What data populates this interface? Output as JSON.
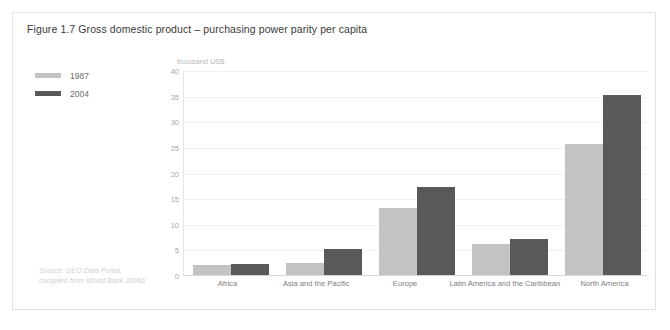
{
  "figure": {
    "title": "Figure 1.7 Gross domestic product – purchasing power parity per capita",
    "source": "Source: GEO Data Portal, compiled from World Bank 2006b"
  },
  "legend": {
    "items": [
      {
        "label": "1987",
        "color": "#c3c3c3"
      },
      {
        "label": "2004",
        "color": "#595959"
      }
    ]
  },
  "chart_data": {
    "type": "bar",
    "title": "Figure 1.7 Gross domestic product – purchasing power parity per capita",
    "xlabel": "",
    "ylabel": "thousand US$",
    "unit_label": "thousand US$",
    "categories": [
      "Africa",
      "Asia and the Pacific",
      "Europe",
      "Latin America and the Caribbean",
      "North America"
    ],
    "series": [
      {
        "name": "1987",
        "color": "#c3c3c3",
        "values": [
          2.0,
          2.4,
          13.0,
          6.0,
          25.5
        ]
      },
      {
        "name": "2004",
        "color": "#595959",
        "values": [
          2.1,
          5.0,
          17.1,
          7.1,
          35.1
        ]
      }
    ],
    "ylim": [
      0,
      40
    ],
    "yticks": [
      0,
      5,
      10,
      15,
      20,
      25,
      30,
      35,
      40
    ],
    "ytick_labels": [
      "0",
      "5",
      "10",
      "15",
      "20",
      "25",
      "30",
      "35",
      "40"
    ],
    "grid": true,
    "legend_position": "left"
  }
}
